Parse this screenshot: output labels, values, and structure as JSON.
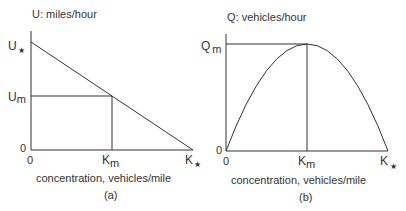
{
  "panel_a": {
    "y_axis_title": "U:  miles/hour",
    "y_top_label": "U",
    "y_top_sub": "★",
    "y_mid_label": "U",
    "y_mid_sub": "m",
    "y_zero": "0",
    "x_zero": "0",
    "x_mid_label": "K",
    "x_mid_sub": "m",
    "x_end_label": "K",
    "x_end_sub": "★",
    "x_axis_title": "concentration, vehicles/mile",
    "caption": "(a)"
  },
  "panel_b": {
    "y_axis_title": "Q:  vehicles/hour",
    "y_top_label": "Q",
    "y_top_sub": "m",
    "y_zero": "0",
    "x_zero": "0",
    "x_mid_label": "K",
    "x_mid_sub": "m",
    "x_end_label": "K",
    "x_end_sub": "★",
    "x_axis_title": "concentration, vehicles/mile",
    "caption": "(b)"
  },
  "colors": {
    "line": "#333333",
    "text": "#333333",
    "background": "#ffffff"
  }
}
